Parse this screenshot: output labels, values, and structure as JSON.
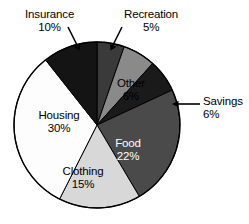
{
  "chart_data": {
    "type": "pie",
    "title": "",
    "subtitle": "",
    "xlabel": "",
    "ylabel": "",
    "units": "percent",
    "legend_position": "none",
    "grid": false,
    "total": 94,
    "categories": [
      "Recreation",
      "Other",
      "Savings",
      "Food",
      "Clothing",
      "Housing",
      "Insurance"
    ],
    "values": [
      5,
      6,
      6,
      22,
      15,
      30,
      10
    ],
    "slices": [
      {
        "name": "Recreation",
        "label": "Recreation",
        "value": 5,
        "value_text": "5%",
        "color": "#3a3a3a",
        "text_color": "#000000",
        "label_placement": "callout",
        "callout_side": "top-right"
      },
      {
        "name": "Other",
        "label": "Other",
        "value": 6,
        "value_text": "6%",
        "color": "#8a8a8a",
        "text_color": "#000000",
        "label_placement": "inside"
      },
      {
        "name": "Savings",
        "label": "Savings",
        "value": 6,
        "value_text": "6%",
        "color": "#1a1a1a",
        "text_color": "#000000",
        "label_placement": "callout",
        "callout_side": "right"
      },
      {
        "name": "Food",
        "label": "Food",
        "value": 22,
        "value_text": "22%",
        "color": "#4a4a4a",
        "text_color": "#ffffff",
        "label_placement": "inside"
      },
      {
        "name": "Clothing",
        "label": "Clothing",
        "value": 15,
        "value_text": "15%",
        "color": "#d8d8d8",
        "text_color": "#000000",
        "label_placement": "inside"
      },
      {
        "name": "Housing",
        "label": "Housing",
        "value": 30,
        "value_text": "30%",
        "color": "#fdfdfd",
        "text_color": "#000000",
        "label_placement": "inside"
      },
      {
        "name": "Insurance",
        "label": "Insurance",
        "value": 10,
        "value_text": "10%",
        "color": "#141414",
        "text_color": "#000000",
        "label_placement": "callout",
        "callout_side": "top-left"
      }
    ],
    "outline_color": "#000000",
    "background": "#ffffff"
  }
}
